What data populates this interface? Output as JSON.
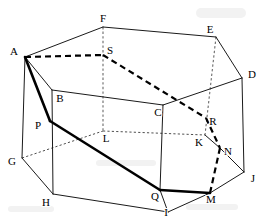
{
  "figure": {
    "kind": "geometry-diagram",
    "width": 263,
    "height": 218,
    "background_color": "#ffffff",
    "ink_color": "#000000"
  },
  "vertices": [
    {
      "id": "A",
      "label": "A",
      "x": 25,
      "y": 57,
      "lx": 14,
      "ly": 52
    },
    {
      "id": "B",
      "label": "B",
      "x": 52,
      "y": 90,
      "lx": 60,
      "ly": 99
    },
    {
      "id": "C",
      "label": "C",
      "x": 163,
      "y": 105,
      "lx": 158,
      "ly": 113
    },
    {
      "id": "D",
      "label": "D",
      "x": 242,
      "y": 78,
      "lx": 252,
      "ly": 75
    },
    {
      "id": "E",
      "label": "E",
      "x": 216,
      "y": 37,
      "lx": 210,
      "ly": 30
    },
    {
      "id": "F",
      "label": "F",
      "x": 103,
      "y": 27,
      "lx": 103,
      "ly": 19
    },
    {
      "id": "G",
      "label": "G",
      "x": 22,
      "y": 158,
      "lx": 12,
      "ly": 162
    },
    {
      "id": "H",
      "label": "H",
      "x": 53,
      "y": 194,
      "lx": 46,
      "ly": 203
    },
    {
      "id": "I",
      "label": "I",
      "x": 168,
      "y": 212,
      "lx": 166,
      "ly": 213
    },
    {
      "id": "J",
      "label": "J",
      "x": 244,
      "y": 172,
      "lx": 253,
      "ly": 179
    },
    {
      "id": "K",
      "label": "K",
      "x": 205,
      "y": 135,
      "lx": 199,
      "ly": 143
    },
    {
      "id": "L",
      "label": "L",
      "x": 103,
      "y": 131,
      "lx": 106,
      "ly": 139
    },
    {
      "id": "M",
      "label": "M",
      "x": 210,
      "y": 193,
      "lx": 211,
      "ly": 200
    },
    {
      "id": "N",
      "label": "N",
      "x": 220,
      "y": 148,
      "lx": 228,
      "ly": 152
    },
    {
      "id": "P",
      "label": "P",
      "x": 50,
      "y": 121,
      "lx": 38,
      "ly": 126
    },
    {
      "id": "Q",
      "label": "Q",
      "x": 160,
      "y": 190,
      "lx": 155,
      "ly": 197
    },
    {
      "id": "R",
      "label": "R",
      "x": 206,
      "y": 118,
      "lx": 213,
      "ly": 122
    },
    {
      "id": "S",
      "label": "S",
      "x": 103,
      "y": 55,
      "lx": 110,
      "ly": 51
    }
  ],
  "edges": {
    "solid": [
      {
        "name": "edge-A-F",
        "from": "A",
        "to": "F"
      },
      {
        "name": "edge-F-E",
        "from": "F",
        "to": "E"
      },
      {
        "name": "edge-E-D",
        "from": "E",
        "to": "D"
      },
      {
        "name": "edge-A-B",
        "from": "A",
        "to": "B"
      },
      {
        "name": "edge-B-C",
        "from": "B",
        "to": "C"
      },
      {
        "name": "edge-C-D",
        "from": "C",
        "to": "D"
      },
      {
        "name": "edge-A-G",
        "from": "A",
        "to": "G"
      },
      {
        "name": "edge-B-H",
        "from": "B",
        "to": "H"
      },
      {
        "name": "edge-C-Q",
        "from": "C",
        "to": "Q"
      },
      {
        "name": "edge-D-J",
        "from": "D",
        "to": "J"
      },
      {
        "name": "edge-G-H",
        "from": "G",
        "to": "H"
      },
      {
        "name": "edge-H-I",
        "from": "H",
        "to": "I"
      },
      {
        "name": "edge-I-M",
        "from": "I",
        "to": "M"
      },
      {
        "name": "edge-M-J",
        "from": "M",
        "to": "J"
      },
      {
        "name": "edge-I-Q",
        "from": "I",
        "to": "Q"
      },
      {
        "name": "edge-K-N",
        "from": "K",
        "to": "N"
      },
      {
        "name": "edge-N-J",
        "from": "N",
        "to": "J"
      }
    ],
    "thick": [
      {
        "name": "path-A-P",
        "from": "A",
        "to": "P"
      },
      {
        "name": "path-P-Q",
        "from": "P",
        "to": "Q"
      },
      {
        "name": "path-Q-M",
        "from": "Q",
        "to": "M"
      }
    ],
    "dashed": [
      {
        "name": "hidden-A-S",
        "from": "A",
        "to": "S"
      },
      {
        "name": "hidden-S-R",
        "from": "S",
        "to": "R"
      },
      {
        "name": "hidden-R-N",
        "from": "R",
        "to": "N"
      },
      {
        "name": "hidden-N-M",
        "from": "N",
        "to": "M"
      }
    ],
    "dotted": [
      {
        "name": "construction-G-L",
        "from": "G",
        "to": "L"
      },
      {
        "name": "construction-L-K",
        "from": "L",
        "to": "K"
      }
    ],
    "dotted_vertical": [
      {
        "name": "axis-F-L",
        "from": "F",
        "to": "L"
      },
      {
        "name": "axis-E-K",
        "from": "E",
        "to": "K"
      }
    ]
  },
  "annotations": {
    "top_face": "A-F-E-D-C-B",
    "bottom_face": "G-H-I-M-J",
    "highlighted_path": "A-P-Q-M",
    "hidden_path": "A-S-R-N-M"
  }
}
